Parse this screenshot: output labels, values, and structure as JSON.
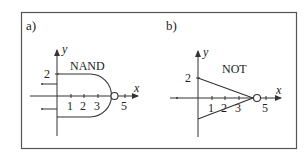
{
  "figure": {
    "border_color": "#555555",
    "line_color": "#333333",
    "panels": [
      {
        "id": "a",
        "panel_label": "a)",
        "gate_name": "NAND",
        "axis_x_label": "x",
        "axis_y_label": "y",
        "y_tick_label": "2",
        "x_tick_labels": [
          "1",
          "2",
          "3",
          "5"
        ],
        "inputs": 2,
        "output_bubble": true
      },
      {
        "id": "b",
        "panel_label": "b)",
        "gate_name": "NOT",
        "axis_x_label": "x",
        "axis_y_label": "y",
        "y_tick_label": "2",
        "x_tick_labels": [
          "1",
          "2",
          "3",
          "5"
        ],
        "inputs": 1,
        "output_bubble": true
      }
    ]
  }
}
